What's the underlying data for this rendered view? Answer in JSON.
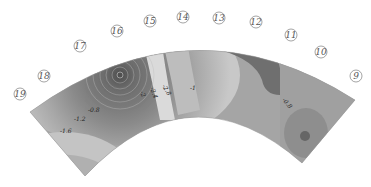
{
  "diagram": {
    "type": "contour-plot-annular-sector",
    "rendering": "grayscale",
    "position_markers": [
      "9",
      "10",
      "11",
      "12",
      "13",
      "14",
      "15",
      "16",
      "17",
      "18",
      "19"
    ],
    "contour_labels": [
      "-0.8",
      "-1.2",
      "-1.6",
      "-2",
      "-2.4",
      "-2.8",
      "-1",
      "-2.8",
      "-1.6",
      "-1.2",
      "-0.8"
    ],
    "colors": {
      "darkest": "#5a5a5a",
      "dark": "#7a7a7a",
      "mid": "#9a9a9a",
      "light": "#bdbdbd",
      "lightest": "#dcdcdc",
      "marker_stroke": "#666666"
    }
  }
}
